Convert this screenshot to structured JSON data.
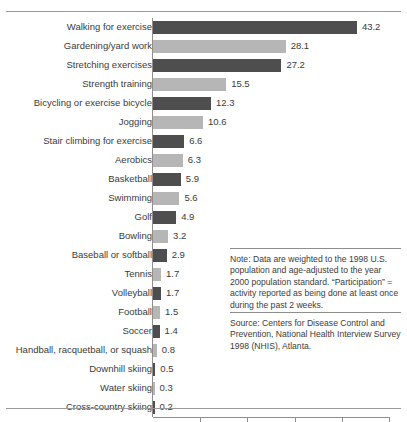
{
  "chart_data": {
    "type": "bar",
    "orientation": "horizontal",
    "title": "",
    "xlabel": "",
    "ylabel": "",
    "xlim": [
      0,
      50
    ],
    "xticks": [
      0,
      10,
      20,
      30,
      40,
      50
    ],
    "xtick_labels": [
      "0",
      "10",
      "20",
      "30",
      "40",
      "50"
    ],
    "grid": false,
    "legend": null,
    "categories": [
      "Walking for exercise",
      "Gardening/yard work",
      "Stretching exercises",
      "Strength training",
      "Bicycling or exercise bicycle",
      "Jogging",
      "Stair climbing for exercise",
      "Aerobics",
      "Basketball",
      "Swimming",
      "Golf",
      "Bowling",
      "Baseball or softball",
      "Tennis",
      "Volleyball",
      "Football",
      "Soccer",
      "Handball, racquetball, or squash",
      "Downhill skiing",
      "Water skiing",
      "Cross-country skiing"
    ],
    "values": [
      43.2,
      28.1,
      27.2,
      15.5,
      12.3,
      10.6,
      6.6,
      6.3,
      5.9,
      5.6,
      4.9,
      3.2,
      2.9,
      1.7,
      1.7,
      1.5,
      1.4,
      0.8,
      0.5,
      0.3,
      0.2
    ],
    "value_labels": [
      "43.2",
      "28.1",
      "27.2",
      "15.5",
      "12.3",
      "10.6",
      "6.6",
      "6.3",
      "5.9",
      "5.6",
      "4.9",
      "3.2",
      "2.9",
      "1.7",
      "1.7",
      "1.5",
      "1.4",
      "0.8",
      "0.5",
      "0.3",
      "0.2"
    ],
    "bar_colors": [
      "#4e4e4e",
      "#b6b6b6",
      "#4e4e4e",
      "#b6b6b6",
      "#4e4e4e",
      "#b6b6b6",
      "#4e4e4e",
      "#b6b6b6",
      "#4e4e4e",
      "#b6b6b6",
      "#4e4e4e",
      "#b6b6b6",
      "#4e4e4e",
      "#b6b6b6",
      "#4e4e4e",
      "#b6b6b6",
      "#4e4e4e",
      "#b6b6b6",
      "#4e4e4e",
      "#b6b6b6",
      "#4e4e4e"
    ]
  },
  "annotations": {
    "note": "Note: Data are weighted to the 1998 U.S. population and age-adjusted to the year 2000 population standard. “Participation” = activity reported as being done at least once during the past 2 weeks.",
    "source": "Source: Centers for Disease Control and Prevention, National Health Interview Survey 1998 (NHIS), Atlanta."
  },
  "colors": {
    "bar_dark": "#4e4e4e",
    "bar_light": "#b6b6b6",
    "axis": "#8e8e8e",
    "rule": "#9a9a9a",
    "text": "#3b3b3b",
    "background": "#ffffff"
  }
}
